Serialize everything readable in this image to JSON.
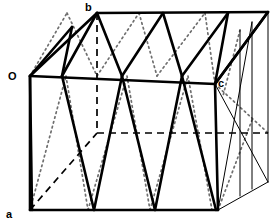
{
  "figure": {
    "kind": "geometry-diagram",
    "background_color": "#ffffff",
    "stroke_color": "#000000",
    "hidden_dotted_color": "#6f6f6f",
    "canvas": {
      "width": 280,
      "height": 223
    },
    "labels": [
      {
        "id": "label-O",
        "text": "O",
        "x": 8,
        "y": 80
      },
      {
        "id": "label-a",
        "text": "a",
        "x": 6,
        "y": 218
      },
      {
        "id": "label-b",
        "text": "b",
        "x": 85,
        "y": 11
      },
      {
        "id": "label-c",
        "text": "c",
        "x": 218,
        "y": 87
      }
    ],
    "vertices": {
      "O": {
        "x": 30,
        "y": 76,
        "name": "origin-vertex"
      },
      "a": {
        "x": 30,
        "y": 210,
        "name": "vertex-a"
      },
      "b": {
        "x": 97,
        "y": 13,
        "name": "vertex-b"
      },
      "c": {
        "x": 215,
        "y": 84,
        "name": "vertex-c"
      },
      "front_bottom_right": {
        "x": 218,
        "y": 210
      },
      "top_back_right": {
        "x": 268,
        "y": 12
      },
      "hidden_back_bottom_left": {
        "x": 97,
        "y": 133
      },
      "hidden_back_bottom_right": {
        "x": 268,
        "y": 133
      },
      "far_bottom_right": {
        "x": 268,
        "y": 182
      }
    },
    "edges": {
      "front_face": [
        "O-a",
        "a-front_bottom_right",
        "front_bottom_right-c",
        "c-O"
      ],
      "top_face": [
        "O-b",
        "b-top_back_right",
        "top_back_right-c",
        "c-O"
      ],
      "right_face": [
        "c-front_bottom_right",
        "c-top_back_right",
        "top_back_right-far_bottom_right",
        "far_bottom_right-front_bottom_right"
      ],
      "hidden": [
        "b-hidden_back_bottom_left",
        "a-hidden_back_bottom_left",
        "hidden_back_bottom_left-hidden_back_bottom_right"
      ]
    },
    "line_styles": {
      "visible_edge": "solid-thick",
      "far_edge": "solid-thin",
      "hidden_edge_near": "dashed",
      "hidden_edge_far": "dotted"
    }
  }
}
